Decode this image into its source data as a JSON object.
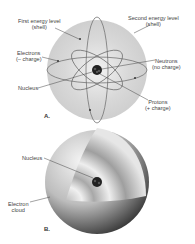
{
  "panel_a": {
    "label": "A.",
    "first_shell": {
      "line1": "First energy level",
      "line2": "(shell)"
    },
    "second_shell": {
      "line1": "Second energy level",
      "line2": "(shell)"
    },
    "electrons": {
      "line1": "Electrons",
      "line2": "(– charge)"
    },
    "neutrons": {
      "line1": "Neutrons",
      "line2": "(no charge)"
    },
    "nucleus": "Nucleus",
    "protons": {
      "line1": "Protons",
      "line2": "(+ charge)"
    }
  },
  "panel_b": {
    "label": "B.",
    "nucleus": "Nucleus",
    "electron_cloud": {
      "line1": "Electron",
      "line2": "cloud"
    }
  }
}
